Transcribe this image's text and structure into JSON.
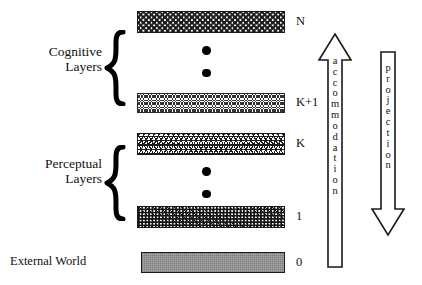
{
  "diagram": {
    "groups": [
      {
        "name": "cognitive",
        "line1": "Cognitive",
        "line2": "Layers"
      },
      {
        "name": "perceptual",
        "line1": "Perceptual",
        "line2": "Layers"
      }
    ],
    "external_world_label": "External World",
    "layers": [
      {
        "id": "N",
        "index_label": "N",
        "pattern": "diagonal-dash-crosshatch"
      },
      {
        "id": "K+1",
        "index_label": "K+1",
        "pattern": "sparse-triangles"
      },
      {
        "id": "K",
        "index_label": "K",
        "pattern": "honeycomb-scale"
      },
      {
        "id": "1",
        "index_label": "1",
        "pattern": "dense-speckle"
      },
      {
        "id": "0",
        "index_label": "0",
        "pattern": "solid-gray"
      }
    ],
    "ellipses": [
      {
        "name": "cognitive-ellipsis",
        "dot_count": 2
      },
      {
        "name": "perceptual-ellipsis",
        "dot_count": 2
      }
    ],
    "arrows": [
      {
        "name": "accommodation",
        "label": "accommodation",
        "letters": [
          "a",
          "c",
          "c",
          "o",
          "m",
          "m",
          "o",
          "d",
          "a",
          "t",
          "i",
          "o",
          "n"
        ],
        "direction": "up"
      },
      {
        "name": "projection",
        "label": "projection",
        "letters": [
          "p",
          "r",
          "o",
          "j",
          "e",
          "c",
          "t",
          "i",
          "o",
          "n"
        ],
        "direction": "down"
      }
    ],
    "colors": {
      "ink": "#111111",
      "stroke": "#1a1a1a",
      "external_world_fill": "#a6a6a6",
      "background": "#ffffff"
    }
  }
}
